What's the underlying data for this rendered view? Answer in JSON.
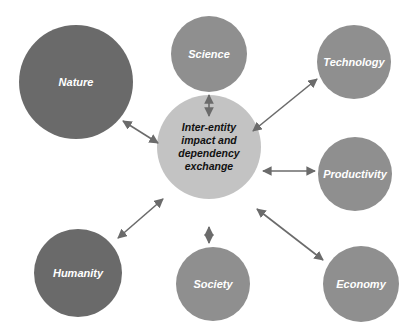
{
  "diagram": {
    "type": "hub-and-spoke",
    "center": {
      "label": "Inter-entity impact and dependency exchange",
      "lines": [
        "Inter-entity",
        "impact and",
        "dependency",
        "exchange"
      ],
      "color": "#c3c3c3",
      "text_color": "#111111"
    },
    "nodes": [
      {
        "id": "nature",
        "label": "Nature",
        "color": "#6a6a6a"
      },
      {
        "id": "science",
        "label": "Science",
        "color": "#8f8f8f"
      },
      {
        "id": "technology",
        "label": "Technology",
        "color": "#8f8f8f"
      },
      {
        "id": "productivity",
        "label": "Productivity",
        "color": "#8f8f8f"
      },
      {
        "id": "economy",
        "label": "Economy",
        "color": "#8f8f8f"
      },
      {
        "id": "society",
        "label": "Society",
        "color": "#8f8f8f"
      },
      {
        "id": "humanity",
        "label": "Humanity",
        "color": "#6a6a6a"
      }
    ],
    "edges": [
      {
        "from": "center",
        "to": "nature",
        "style": "double-arrow"
      },
      {
        "from": "center",
        "to": "science",
        "style": "double-arrow"
      },
      {
        "from": "center",
        "to": "technology",
        "style": "double-arrow"
      },
      {
        "from": "center",
        "to": "productivity",
        "style": "double-arrow"
      },
      {
        "from": "center",
        "to": "economy",
        "style": "double-arrow"
      },
      {
        "from": "center",
        "to": "society",
        "style": "double-arrow"
      },
      {
        "from": "center",
        "to": "humanity",
        "style": "double-arrow"
      }
    ],
    "arrow_color": "#6b6b6b"
  }
}
